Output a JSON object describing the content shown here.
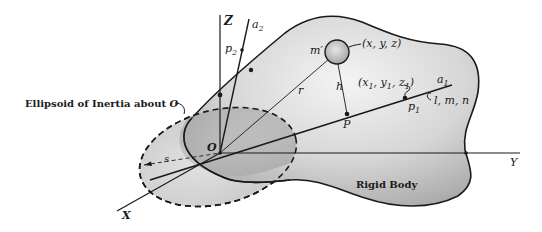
{
  "figure": {
    "labels": {
      "z_axis": "Z",
      "y_axis": "Y",
      "x_axis": "X",
      "origin": "O",
      "axis_a2": "a",
      "axis_a2_sub": "2",
      "axis_a1": "a",
      "axis_a1_sub": "1",
      "point_p2": "p",
      "point_p2_sub": "2",
      "point_p1": "p",
      "point_p1_sub": "1",
      "point_P": "P",
      "mass": "m′",
      "mass_coords": "(x, y, z)",
      "p1_coords_open": "(x",
      "p1_coords_sub1": "1",
      "p1_coords_mid1": ", y",
      "p1_coords_sub2": "1",
      "p1_coords_mid2": ", z",
      "p1_coords_sub3": "1",
      "p1_coords_close": ")",
      "direction_cosines": "l, m, n",
      "radius_vector": "r",
      "distance": "h",
      "semi_axis": "s",
      "ellipsoid_caption": "Ellipsoid of Inertia about ",
      "ellipsoid_caption_O": "O",
      "body_caption": "Rigid Body"
    },
    "colors": {
      "ink": "#1a1a1a",
      "body_fill_light": "#f2f2f2",
      "body_fill_dark": "#a8a8a8",
      "ellipse_fill": "#c8c8c8"
    }
  }
}
